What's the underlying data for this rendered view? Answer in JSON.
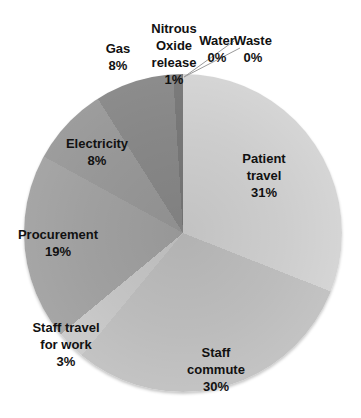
{
  "page": {
    "background": "#ffffff",
    "text_color": "#111111",
    "leader_line_color": "#9a9a9a"
  },
  "chart_data": {
    "type": "pie",
    "title": "",
    "legend_position": "none",
    "label_style": "category name + percent, bold, placed in/near slices",
    "direction": "clockwise",
    "start_angle_deg": 0,
    "unit": "%",
    "categories": [
      "Patient travel",
      "Staff commute",
      "Staff travel for work",
      "Procurement",
      "Electricity",
      "Gas",
      "Nitrous Oxide release",
      "Water",
      "Waste"
    ],
    "values": [
      31,
      30,
      3,
      19,
      8,
      8,
      1,
      0,
      0
    ],
    "center_px": {
      "x": 183,
      "y": 233
    },
    "radius_px": 159,
    "slices": [
      {
        "name": "patient-travel",
        "label": "Patient\ntravel\n31%",
        "value": 31,
        "color": "#d8d8d8",
        "label_x": 264,
        "label_y": 175
      },
      {
        "name": "staff-commute",
        "label": "Staff\ncommute\n30%",
        "value": 30,
        "color": "#c6c6c6",
        "label_x": 216,
        "label_y": 369
      },
      {
        "name": "staff-travel-for-work",
        "label": "Staff travel\nfor work\n3%",
        "value": 3,
        "color": "#cfcfcf",
        "label_x": 66,
        "label_y": 344
      },
      {
        "name": "procurement",
        "label": "Procurement\n19%",
        "value": 19,
        "color": "#a8a8a8",
        "label_x": 58,
        "label_y": 243
      },
      {
        "name": "electricity",
        "label": "Electricity\n8%",
        "value": 8,
        "color": "#9f9f9f",
        "label_x": 97,
        "label_y": 152
      },
      {
        "name": "gas",
        "label": "Gas\n8%",
        "value": 8,
        "color": "#8e8e8e",
        "label_x": 118,
        "label_y": 57
      },
      {
        "name": "nitrous-oxide-release",
        "label": "Nitrous\nOxide\nrelease\n1%",
        "value": 1,
        "color": "#7d7d7d",
        "label_x": 174,
        "label_y": 54
      },
      {
        "name": "water",
        "label": "Water\n0%",
        "value": 0,
        "color": "#d8d8d8",
        "label_x": 217,
        "label_y": 49
      },
      {
        "name": "waste",
        "label": "Waste\n0%",
        "value": 0,
        "color": "#d8d8d8",
        "label_x": 253,
        "label_y": 49
      }
    ],
    "leader_lines": [
      {
        "x1": 184,
        "y1": 77,
        "x2": 234,
        "y2": 41
      },
      {
        "x1": 184,
        "y1": 77,
        "x2": 240,
        "y2": 48
      }
    ]
  }
}
